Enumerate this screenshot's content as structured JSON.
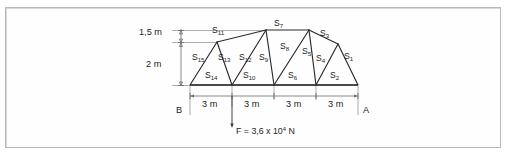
{
  "figure": {
    "type": "statics-truss-diagram",
    "dimensions": {
      "vertical": [
        {
          "id": "dim-1-5m",
          "label": "1,5 m"
        },
        {
          "id": "dim-2m",
          "label": "2 m"
        }
      ],
      "horizontal": {
        "segments": [
          "3 m",
          "3 m",
          "3 m",
          "3 m"
        ],
        "total_span_m": 12
      }
    },
    "supports": {
      "left": {
        "label": "B"
      },
      "right": {
        "label": "A"
      }
    },
    "load": {
      "label": "F = 3,6 x 10",
      "exponent": "4",
      "unit": " N",
      "full_text": "F = 3,6 x 10⁴ N"
    },
    "members": [
      {
        "prefix": "S",
        "sub": "1"
      },
      {
        "prefix": "S",
        "sub": "2"
      },
      {
        "prefix": "S",
        "sub": "3"
      },
      {
        "prefix": "S",
        "sub": "4"
      },
      {
        "prefix": "S",
        "sub": "5"
      },
      {
        "prefix": "S",
        "sub": "6"
      },
      {
        "prefix": "S",
        "sub": "7"
      },
      {
        "prefix": "S",
        "sub": "8"
      },
      {
        "prefix": "S",
        "sub": "9"
      },
      {
        "prefix": "S",
        "sub": "10"
      },
      {
        "prefix": "S",
        "sub": "11"
      },
      {
        "prefix": "S",
        "sub": "12"
      },
      {
        "prefix": "S",
        "sub": "13"
      },
      {
        "prefix": "S",
        "sub": "14"
      },
      {
        "prefix": "S",
        "sub": "15"
      }
    ],
    "colors": {
      "line": "#2a2a2a",
      "bottom_chord": "#4a4a4a",
      "dimension": "#6d6d6d",
      "frame": "#b9b9b9",
      "background": "#ffffff"
    }
  }
}
